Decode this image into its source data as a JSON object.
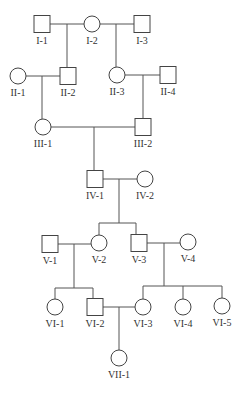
{
  "individuals": [
    {
      "id": "I-1",
      "label": "I-1",
      "sex": "male",
      "x": 42,
      "y": 24
    },
    {
      "id": "I-2",
      "label": "I-2",
      "sex": "female",
      "x": 92,
      "y": 24
    },
    {
      "id": "I-3",
      "label": "I-3",
      "sex": "male",
      "x": 142,
      "y": 24
    },
    {
      "id": "II-1",
      "label": "II-1",
      "sex": "female",
      "x": 18,
      "y": 76
    },
    {
      "id": "II-2",
      "label": "II-2",
      "sex": "male",
      "x": 68,
      "y": 76
    },
    {
      "id": "II-3",
      "label": "II-3",
      "sex": "female",
      "x": 117,
      "y": 75
    },
    {
      "id": "II-4",
      "label": "II-4",
      "sex": "male",
      "x": 168,
      "y": 75
    },
    {
      "id": "III-1",
      "label": "III-1",
      "sex": "female",
      "x": 43,
      "y": 127
    },
    {
      "id": "III-2",
      "label": "III-2",
      "sex": "male",
      "x": 143,
      "y": 127
    },
    {
      "id": "IV-1",
      "label": "IV-1",
      "sex": "male",
      "x": 95,
      "y": 179
    },
    {
      "id": "IV-2",
      "label": "IV-2",
      "sex": "female",
      "x": 145,
      "y": 179
    },
    {
      "id": "V-1",
      "label": "V-1",
      "sex": "male",
      "x": 50,
      "y": 244
    },
    {
      "id": "V-2",
      "label": "V-2",
      "sex": "female",
      "x": 99,
      "y": 243
    },
    {
      "id": "V-3",
      "label": "V-3",
      "sex": "male",
      "x": 139,
      "y": 243
    },
    {
      "id": "V-4",
      "label": "V-4",
      "sex": "female",
      "x": 188,
      "y": 242
    },
    {
      "id": "VI-1",
      "label": "VI-1",
      "sex": "female",
      "x": 55,
      "y": 307
    },
    {
      "id": "VI-2",
      "label": "VI-2",
      "sex": "male",
      "x": 95,
      "y": 307
    },
    {
      "id": "VI-3",
      "label": "VI-3",
      "sex": "female",
      "x": 143,
      "y": 307
    },
    {
      "id": "VI-4",
      "label": "VI-4",
      "sex": "female",
      "x": 183,
      "y": 307
    },
    {
      "id": "VI-5",
      "label": "VI-5",
      "sex": "female",
      "x": 222,
      "y": 306
    },
    {
      "id": "VII-1",
      "label": "VII-1",
      "sex": "female",
      "x": 119,
      "y": 358
    }
  ],
  "lines": [
    [
      50,
      24,
      84,
      24
    ],
    [
      67,
      24,
      67,
      67
    ],
    [
      100,
      24,
      134,
      24
    ],
    [
      116,
      24,
      116,
      67
    ],
    [
      26,
      76,
      60,
      76
    ],
    [
      42,
      76,
      42,
      119
    ],
    [
      125,
      75,
      160,
      75
    ],
    [
      143,
      75,
      143,
      118
    ],
    [
      51,
      127,
      135,
      127
    ],
    [
      94,
      127,
      94,
      171
    ],
    [
      103,
      179,
      137,
      179
    ],
    [
      119,
      179,
      119,
      223
    ],
    [
      99,
      223,
      136,
      223
    ],
    [
      99,
      223,
      99,
      235
    ],
    [
      136,
      223,
      136,
      235
    ],
    [
      58,
      244,
      91,
      244
    ],
    [
      74,
      244,
      74,
      288
    ],
    [
      147,
      243,
      180,
      243
    ],
    [
      164,
      243,
      164,
      286
    ],
    [
      55,
      288,
      93,
      288
    ],
    [
      55,
      288,
      55,
      299
    ],
    [
      93,
      288,
      93,
      298
    ],
    [
      143,
      286,
      222,
      286
    ],
    [
      143,
      286,
      143,
      299
    ],
    [
      183,
      286,
      183,
      299
    ],
    [
      222,
      286,
      222,
      298
    ],
    [
      103,
      307,
      135,
      307
    ],
    [
      119,
      307,
      119,
      350
    ]
  ]
}
